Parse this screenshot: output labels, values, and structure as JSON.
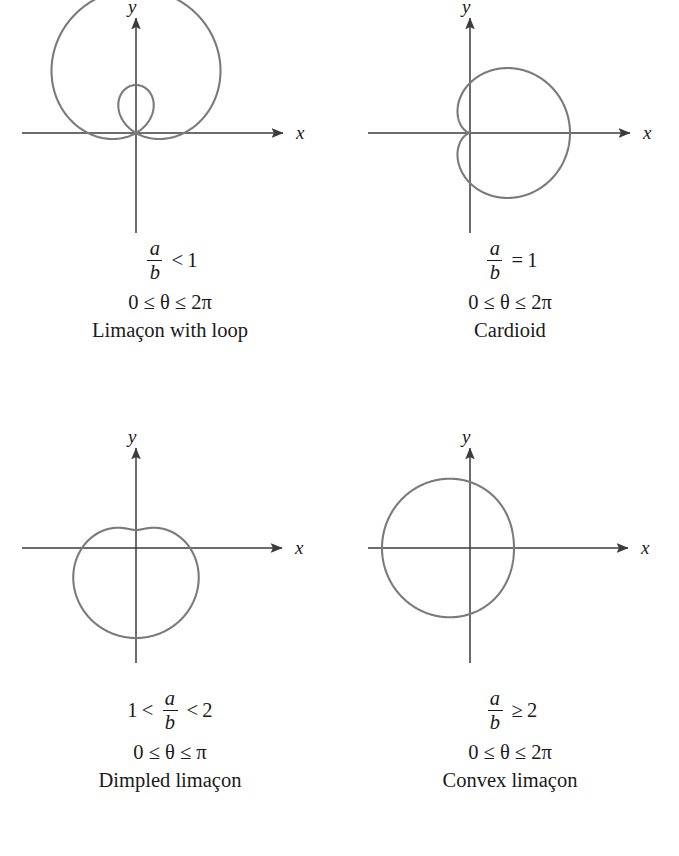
{
  "figure": {
    "axis_labels": {
      "x": "x",
      "y": "y"
    },
    "curve_color": "#7a7a7a",
    "axis_color": "#3b3b3b",
    "text_color": "#1a1a1a"
  },
  "chart_data": {
    "type": "line",
    "xlabel": "x",
    "ylabel": "y",
    "grid": false,
    "legend": "none",
    "panels": [
      {
        "id": "limacon-with-loop",
        "position": "top-left",
        "condition_num": "a",
        "condition_den": "b",
        "relation": "<",
        "relation_value": "1",
        "condition_text": "a/b < 1",
        "domain_text": "0 ≤ θ ≤ 2π",
        "domain_start": "0",
        "domain_end": "2π",
        "label": "Limaçon with loop",
        "a": 1,
        "b": 2,
        "orientation": "sin",
        "theta_max_turns": 1,
        "scale": 48
      },
      {
        "id": "cardioid",
        "position": "top-right",
        "condition_num": "a",
        "condition_den": "b",
        "relation": "=",
        "relation_value": "1",
        "condition_text": "a/b = 1",
        "domain_text": "0 ≤ θ ≤ 2π",
        "domain_start": "0",
        "domain_end": "2π",
        "label": "Cardioid",
        "a": 1,
        "b": 1,
        "orientation": "cos",
        "theta_max_turns": 1,
        "scale": 50
      },
      {
        "id": "dimpled-limacon",
        "position": "bottom-left",
        "condition_prefix": "1",
        "condition_prefix_relation": "<",
        "condition_num": "a",
        "condition_den": "b",
        "relation": "<",
        "relation_value": "2",
        "condition_text": "1 < a/b < 2",
        "domain_text": "0 ≤ θ ≤ π",
        "domain_start": "0",
        "domain_end": "π",
        "label": "Dimpled limaçon",
        "a": 1.5,
        "b": 1,
        "orientation": "neg-sin",
        "theta_max_turns": 1,
        "scale": 36
      },
      {
        "id": "convex-limacon",
        "position": "bottom-right",
        "condition_num": "a",
        "condition_den": "b",
        "relation": "≥",
        "relation_value": "2",
        "condition_text": "a/b ≥ 2",
        "domain_text": "0 ≤ θ ≤ 2π",
        "domain_start": "0",
        "domain_end": "2π",
        "label": "Convex limaçon",
        "a": 3,
        "b": 1,
        "orientation": "neg-cos",
        "theta_max_turns": 1,
        "scale": 22
      }
    ]
  }
}
